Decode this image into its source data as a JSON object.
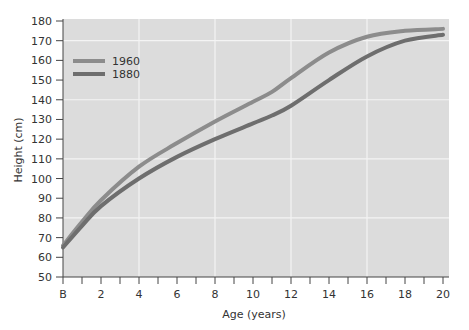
{
  "chart_data": {
    "type": "line",
    "title": "",
    "xlabel": "Age (years)",
    "ylabel": "Height (cm)",
    "xlim": [
      0,
      20
    ],
    "ylim": [
      50,
      180
    ],
    "x_ticks": [
      "B",
      "2",
      "4",
      "6",
      "8",
      "10",
      "12",
      "14",
      "16",
      "18",
      "20"
    ],
    "y_ticks": [
      "50",
      "60",
      "70",
      "80",
      "90",
      "100",
      "110",
      "120",
      "130",
      "140",
      "150",
      "160",
      "170",
      "180"
    ],
    "grid": true,
    "legend_position": "upper-left",
    "x": [
      0,
      1,
      2,
      4,
      6,
      8,
      10,
      11,
      12,
      14,
      16,
      18,
      20
    ],
    "series": [
      {
        "name": "1960",
        "color": "#8c8c8c",
        "values": [
          66,
          78,
          89,
          106,
          118,
          129,
          139,
          144,
          151,
          164,
          172,
          175,
          176
        ]
      },
      {
        "name": "1880",
        "color": "#6e6e6e",
        "values": [
          65,
          76,
          86,
          100,
          111,
          120,
          128,
          132,
          137,
          150,
          162,
          170,
          173
        ]
      }
    ]
  }
}
